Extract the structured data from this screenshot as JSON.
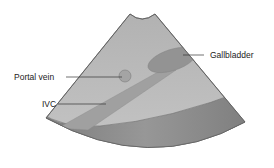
{
  "diagram": {
    "type": "ultrasound-schematic",
    "labels": {
      "gallbladder": "Gallbladder",
      "portal_vein": "Portal vein",
      "ivc": "IVC"
    },
    "colors": {
      "background": "#ffffff",
      "sector_light": "#b8b8b8",
      "sector_far_field": "#8a8a8a",
      "organ_dark": "#979797",
      "outline": "#555555",
      "leader_line": "#333333",
      "text": "#222222"
    }
  }
}
